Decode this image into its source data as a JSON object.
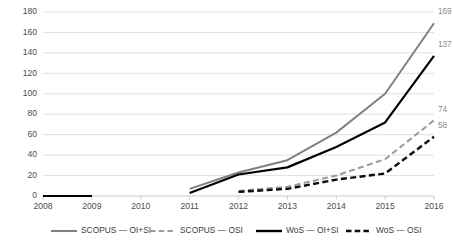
{
  "chart_data": {
    "type": "line",
    "title": "",
    "subtitle": "",
    "xlabel": "",
    "ylabel": "",
    "x": [
      "2008",
      "2009",
      "2010",
      "2011",
      "2012",
      "2013",
      "2014",
      "2015",
      "2016"
    ],
    "categories": [
      "2008",
      "2009",
      "2010",
      "2011",
      "2012",
      "2013",
      "2014",
      "2015",
      "2016"
    ],
    "xlim": [
      2008,
      2016
    ],
    "ylim": [
      0,
      180
    ],
    "yticks": [
      0,
      20,
      40,
      60,
      80,
      100,
      120,
      140,
      160,
      180
    ],
    "xticks": [
      "2008",
      "2009",
      "2010",
      "2011",
      "2012",
      "2013",
      "2014",
      "2015",
      "2016"
    ],
    "grid": "horizontal",
    "legend_position": "bottom",
    "series": [
      {
        "name": "SCOPUS — OI+SI",
        "color": "#808080",
        "style": "solid",
        "width": 2.0,
        "values": [
          0,
          0,
          null,
          7,
          23,
          35,
          62,
          100,
          169
        ],
        "end_label": "169"
      },
      {
        "name": "SCOPUS — OSI",
        "color": "#9a9a9a",
        "style": "dashed",
        "width": 2.0,
        "values": [
          null,
          null,
          null,
          null,
          5,
          9,
          20,
          36,
          74
        ],
        "end_label": "74"
      },
      {
        "name": "WoS — OI+SI",
        "color": "#000000",
        "style": "solid",
        "width": 2.2,
        "values": [
          0,
          0,
          null,
          3,
          21,
          28,
          48,
          72,
          137
        ],
        "end_label": "137"
      },
      {
        "name": "WoS — OSI",
        "color": "#0d0d0d",
        "style": "dashed",
        "width": 2.4,
        "values": [
          null,
          null,
          null,
          null,
          4,
          7,
          16,
          22,
          58
        ],
        "end_label": "58"
      }
    ],
    "data_labels": [
      {
        "text": "169",
        "series": "SCOPUS — OI+SI",
        "x": "2016",
        "value": 169
      },
      {
        "text": "137",
        "series": "WoS — OI+SI",
        "x": "2016",
        "value": 137
      },
      {
        "text": "74",
        "series": "SCOPUS — OSI",
        "x": "2016",
        "value": 74
      },
      {
        "text": "58",
        "series": "WoS — OSI",
        "x": "2016",
        "value": 58
      }
    ]
  },
  "legend": {
    "items": [
      {
        "label": "SCOPUS — OI+SI",
        "color": "#808080",
        "style": "solid"
      },
      {
        "label": "SCOPUS — OSI",
        "color": "#9a9a9a",
        "style": "dashed"
      },
      {
        "label": "WoS — OI+SI",
        "color": "#000000",
        "style": "solid"
      },
      {
        "label": "WoS — OSI",
        "color": "#0d0d0d",
        "style": "dashed"
      }
    ]
  },
  "axes": {
    "y_labels": [
      "180",
      "160",
      "140",
      "120",
      "100",
      "80",
      "60",
      "40",
      "20",
      "0"
    ],
    "x_labels": [
      "2008",
      "2009",
      "2010",
      "2011",
      "2012",
      "2013",
      "2014",
      "2015",
      "2016"
    ]
  }
}
